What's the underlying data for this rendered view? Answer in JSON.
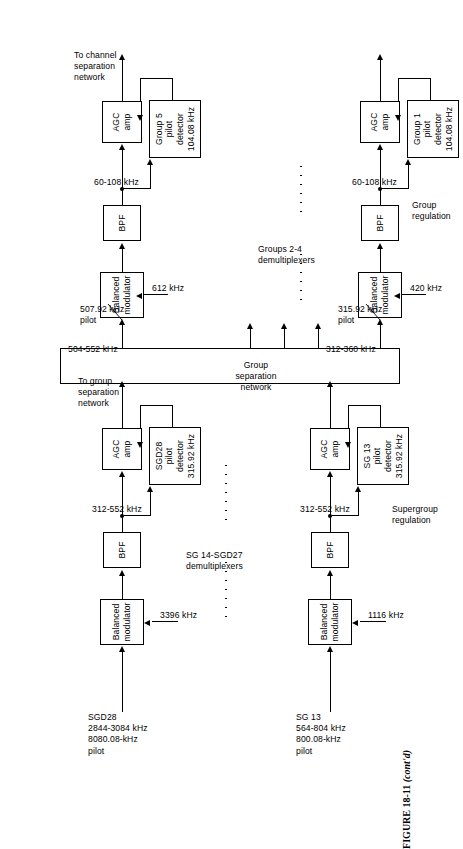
{
  "figure": {
    "caption_number": "FIGURE 18-11",
    "caption_note": "(cont'd)"
  },
  "sections": {
    "supergroup_regulation": "Supergroup\nregulation",
    "group_regulation": "Group\nregulation"
  },
  "networks": {
    "group_separation_network": "Group\nseparation\nnetwork",
    "to_group_separation_network": "To group\nseparation\nnetwork",
    "to_channel_separation_network": "To channel\nseparation\nnetwork"
  },
  "demux_runs": {
    "supergroup_run": "SG 14-SGD27\ndemultiplexers",
    "group_run": "Groups 2-4\ndemultiplexers"
  },
  "chain_sg13": {
    "input_label": "SG 13\n564-804 kHz\n800.08-kHz\npilot",
    "balanced_modulator": "Balanced\nmodulator",
    "carrier": "1116 kHz",
    "bpf": "BPF",
    "band": "312-552 kHz",
    "pilot_detector": "SG 13\npilot\ndetector\n315.92 kHz",
    "agc": "AGC\namp"
  },
  "chain_sgd28": {
    "input_label": "SGD28\n2844-3084 kHz\n8080.08-kHz\npilot",
    "balanced_modulator": "Balanced\nmodulator",
    "carrier": "3396 kHz",
    "bpf": "BPF",
    "band": "312-552 kHz",
    "pilot_detector": "SGD28\npilot\ndetector\n315.92 kHz",
    "agc": "AGC\namp"
  },
  "chain_group1": {
    "tap_band": "312-360 kHz",
    "pilot": "315.92 kHz\npilot",
    "balanced_modulator": "Balanced\nmodulator",
    "carrier": "420 kHz",
    "bpf": "BPF",
    "band": "60-108 kHz",
    "pilot_detector": "Group 1\npilot\ndetector\n104.08 kHz",
    "agc": "AGC\namp"
  },
  "chain_group5": {
    "tap_band": "504-552 kHz",
    "pilot": "507.92 kHz\npilot",
    "balanced_modulator": "Balanced\nmodulator",
    "carrier": "612 kHz",
    "bpf": "BPF",
    "band": "60-108 kHz",
    "pilot_detector": "Group 5\npilot\ndetector\n104.08 kHz",
    "agc": "AGC\namp"
  }
}
